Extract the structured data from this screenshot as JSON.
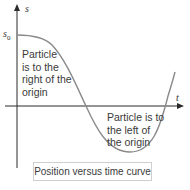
{
  "diagram": {
    "type": "position-time-curve",
    "axes": {
      "y_label": "s",
      "x_label": "t"
    },
    "initial_position_label": "s",
    "initial_position_subscript": "0",
    "regions": [
      {
        "id": "right",
        "lines": [
          "Particle",
          "is to the",
          "right of the",
          "origin"
        ]
      },
      {
        "id": "left",
        "lines": [
          "Particle is to",
          "the left of",
          "the origin"
        ]
      }
    ],
    "caption": "Position versus time curve",
    "colors": {
      "curve": "#8a8a8a",
      "axes": "#2a2a2a",
      "text": "#3a3a3a",
      "caption_border": "#cfcfcf"
    }
  }
}
